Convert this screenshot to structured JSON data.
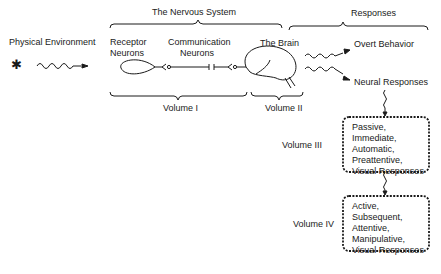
{
  "header": {
    "nervous_system": "The Nervous System",
    "responses": "Responses"
  },
  "labels": {
    "physical_environment": "Physical Environment",
    "receptor_neurons_1": "Receptor",
    "receptor_neurons_2": "Neurons",
    "communication_neurons_1": "Communication",
    "communication_neurons_2": "Neurons",
    "the_brain": "The Brain",
    "overt_behavior": "Overt Behavior",
    "neural_responses": "Neural Responses"
  },
  "volumes": {
    "v1": "Volume I",
    "v2": "Volume II",
    "v3": "Volume III",
    "v4": "Volume IV"
  },
  "boxes": {
    "volume3": [
      "Passive,",
      "Immediate,",
      "Automatic,",
      "Preattentive,",
      "Visual Responses"
    ],
    "volume4": [
      "Active,",
      "Subsequent,",
      "Attentive,",
      "Manipulative,",
      "Visual Responses"
    ]
  },
  "icons": {
    "stimulus": "asterisk-icon"
  }
}
